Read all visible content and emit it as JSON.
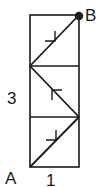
{
  "figure": {
    "type": "geometry-path-diagram",
    "labels": {
      "start_point": "A",
      "end_point": "B",
      "height": "3",
      "width": "1"
    },
    "rectangle": {
      "width_units": 1,
      "height_units": 3,
      "cells": 3
    },
    "path": {
      "description": "Zig-zag path from A to B crossing the rectangle diagonally in each unit square",
      "points": [
        {
          "name": "A",
          "x": 0,
          "y": 0
        },
        {
          "x": 1,
          "y": 1
        },
        {
          "x": 0,
          "y": 2
        },
        {
          "name": "B",
          "x": 1,
          "y": 3
        }
      ],
      "segments": [
        {
          "from": "(0,0)",
          "to": "(1,1)",
          "arrow": "up-right"
        },
        {
          "from": "(1,1)",
          "to": "(0,2)",
          "arrow": "up-left"
        },
        {
          "from": "(0,2)",
          "to": "(1,3)",
          "arrow": "up-right"
        }
      ]
    },
    "colors": {
      "stroke": "#1a1a1a",
      "background": "#ffffff"
    }
  }
}
